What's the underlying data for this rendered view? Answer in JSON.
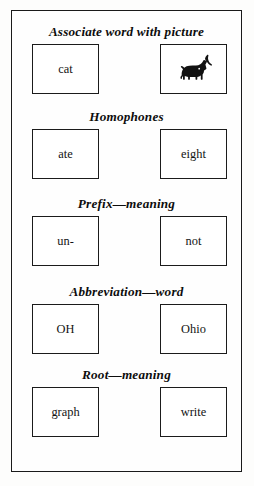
{
  "worksheet": {
    "rows": [
      {
        "heading": "Associate word with picture",
        "left": {
          "type": "text",
          "value": "cat"
        },
        "right": {
          "type": "image",
          "value": "cat-silhouette"
        }
      },
      {
        "heading": "Homophones",
        "left": {
          "type": "text",
          "value": "ate"
        },
        "right": {
          "type": "text",
          "value": "eight"
        }
      },
      {
        "heading": "Prefix—meaning",
        "left": {
          "type": "text",
          "value": "un-"
        },
        "right": {
          "type": "text",
          "value": "not"
        }
      },
      {
        "heading": "Abbreviation—word",
        "left": {
          "type": "text",
          "value": "OH"
        },
        "right": {
          "type": "text",
          "value": "Ohio"
        }
      },
      {
        "heading": "Root—meaning",
        "left": {
          "type": "text",
          "value": "graph"
        },
        "right": {
          "type": "text",
          "value": "write"
        }
      }
    ]
  },
  "colors": {
    "ink": "#1a1a1a",
    "paper": "#fefefe",
    "silhouette": "#111111"
  }
}
